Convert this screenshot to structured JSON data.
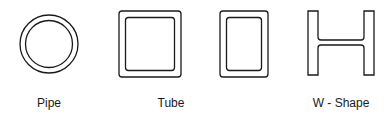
{
  "figure": {
    "shapes": [
      {
        "id": "pipe",
        "label": "Pipe",
        "kind": "hollow-circle"
      },
      {
        "id": "tube",
        "label": "Tube",
        "kind": "hollow-rectangle",
        "variants": [
          "square",
          "rectangular"
        ]
      },
      {
        "id": "w-shape",
        "label": "W - Shape",
        "kind": "wide-flange"
      }
    ],
    "stroke_color": "#1a1a1a",
    "background": "#ffffff"
  }
}
